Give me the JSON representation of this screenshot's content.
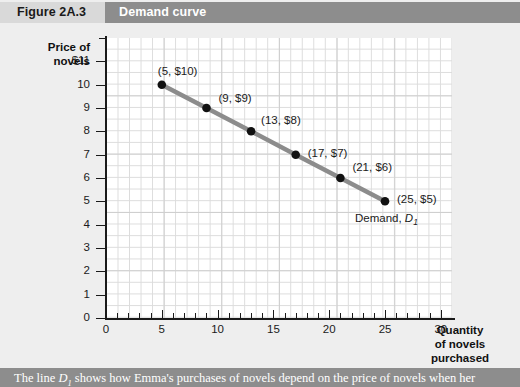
{
  "header": {
    "figure_number": "Figure 2A.3",
    "title": "Demand curve"
  },
  "caption": {
    "prefix": "The line ",
    "curve_symbol": "D",
    "curve_subscript": "1",
    "suffix": " shows how Emma's purchases of novels depend on the price of novels when her"
  },
  "colors": {
    "header_band": "#d9d9d9",
    "title_band": "#8d8d8d",
    "caption_band": "#8d8d8d",
    "page_background": "#eeeeee",
    "plot_background": "#ffffff",
    "grid_minor": "#dcdcdc",
    "grid_major": "#cfcfcf",
    "axis": "#1a1a1a",
    "curve": "#8c8c8c",
    "marker": "#111111"
  },
  "chart_data": {
    "type": "line",
    "title": "Demand curve",
    "xlabel": "Quantity of novels purchased",
    "ylabel": "Price of novels",
    "xlim": [
      0,
      31
    ],
    "ylim": [
      0,
      12
    ],
    "grid": true,
    "legend_position": "inline-right",
    "x_ticks": [
      0,
      5,
      10,
      15,
      20,
      25,
      30
    ],
    "x_tick_labels": [
      "0",
      "5",
      "10",
      "15",
      "20",
      "25",
      "30"
    ],
    "x_minor_tick_step": 1,
    "y_ticks": [
      0,
      1,
      2,
      3,
      4,
      5,
      6,
      7,
      8,
      9,
      10,
      11
    ],
    "y_tick_labels": [
      "0",
      "1",
      "2",
      "3",
      "4",
      "5",
      "6",
      "7",
      "8",
      "9",
      "10",
      "$11"
    ],
    "y_minor_tick_step": 1,
    "series": [
      {
        "name": "Demand, D1",
        "x": [
          5,
          9,
          13,
          17,
          21,
          25
        ],
        "y": [
          10,
          9,
          8,
          7,
          6,
          5
        ],
        "point_labels": [
          "(5, $10)",
          "(9, $9)",
          "(13, $8)",
          "(17, $7)",
          "(21, $6)",
          "(25, $5)"
        ]
      }
    ],
    "annotations": [
      {
        "text": "Demand, D1",
        "x": 26,
        "y": 4.2
      }
    ]
  },
  "axis_titles": {
    "y_line1": "Price of",
    "y_line2": "novels",
    "x_line1": "Quantity",
    "x_line2": "of novels",
    "x_line3": "purchased"
  },
  "curve_label": {
    "text": "Demand, ",
    "symbol": "D",
    "subscript": "1"
  }
}
